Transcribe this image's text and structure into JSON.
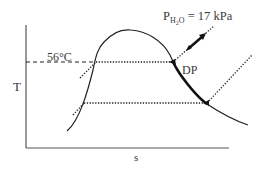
{
  "diagram": {
    "type": "T-s diagram (temperature vs entropy) with saturation dome",
    "axes": {
      "y_label": "T",
      "x_label": "s"
    },
    "annotations": {
      "temperature": "56°C",
      "dew_point": "DP",
      "pressure_symbol": "P",
      "pressure_subscript_main": "H",
      "pressure_subscript_num": "2",
      "pressure_subscript_tail": "O",
      "pressure_value": " = 17 kPa"
    },
    "elements": [
      "saturation dome curve",
      "dashed horizontal line at 56°C from T axis to dome",
      "dotted isotherm across dome at 56°C",
      "dotted isotherm across dome at lower temperature",
      "dotted isobar lines crossing dome",
      "thick segment on vapor line between DP and lower point",
      "arrow along isobar pointing to pressure label"
    ],
    "colors": {
      "line": "#222222",
      "text": "#3a3a3a",
      "axis": "#555555"
    }
  }
}
